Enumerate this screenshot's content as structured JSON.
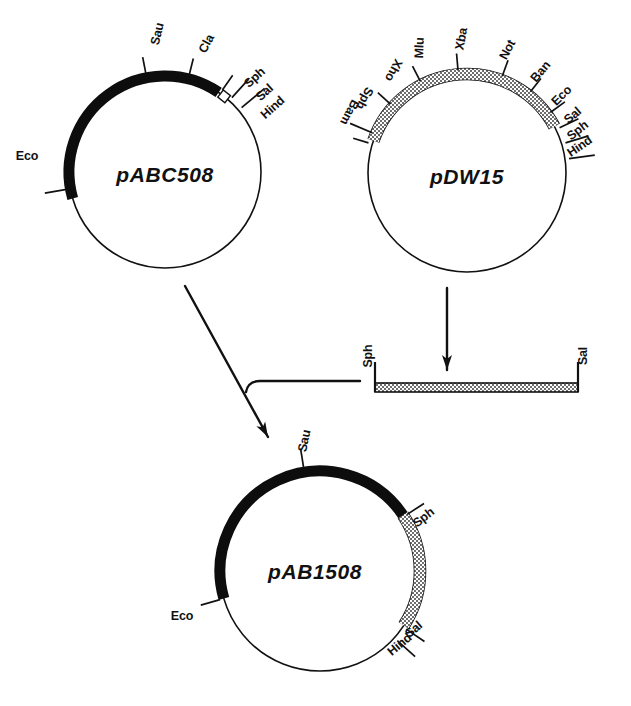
{
  "figure": {
    "background": "#ffffff",
    "ink": "#111111",
    "shaded_fill": "#b4b4b4",
    "black_fill": "#0d0d0d"
  },
  "plasmids": [
    {
      "id": "pABC508",
      "name": "pABC508",
      "name_x": 165,
      "name_y": 176,
      "cx": 165,
      "cy": 172,
      "r": 96,
      "black_arc": {
        "start_deg": 196,
        "end_deg": 56
      },
      "shaded_arc": null,
      "gap_marker": {
        "deg": 52
      },
      "sites": [
        {
          "label": "Sau",
          "deg": 101,
          "tick_len": 17,
          "label_rot": -76,
          "lx": 158,
          "ly": 34
        },
        {
          "label": "Cla",
          "deg": 76,
          "tick_len": 17,
          "label_rot": -62,
          "lx": 207,
          "ly": 44
        },
        {
          "label": "Sph",
          "deg": 55,
          "tick_len": 18,
          "label_rot": -42,
          "lx": 255,
          "ly": 78
        },
        {
          "label": "Sal",
          "deg": 48,
          "tick_len": 25,
          "label_rot": -42,
          "lx": 265,
          "ly": 93
        },
        {
          "label": "Hind",
          "deg": 40,
          "tick_len": 30,
          "label_rot": -42,
          "lx": 273,
          "ly": 108
        },
        {
          "label": "Eco",
          "deg": 190,
          "tick_len": 22,
          "label_rot": 0,
          "lx": 27,
          "ly": 157
        }
      ]
    },
    {
      "id": "pDW15",
      "name": "pDW15",
      "name_x": 467,
      "name_y": 178,
      "cx": 467,
      "cy": 173,
      "r": 99,
      "black_arc": null,
      "shaded_arc": {
        "start_deg": 161,
        "end_deg": 28
      },
      "gap_marker": null,
      "sites": [
        {
          "label": "Bam",
          "deg": 163,
          "tick_len": 16,
          "label_rot": 118,
          "lx": 349,
          "ly": 112
        },
        {
          "label": "Sph",
          "deg": 157,
          "tick_len": 24,
          "label_rot": 118,
          "lx": 364,
          "ly": 98
        },
        {
          "label": "Xho",
          "deg": 138,
          "tick_len": 17,
          "label_rot": 118,
          "lx": 393,
          "ly": 70
        },
        {
          "label": "Mlu",
          "deg": 117,
          "tick_len": 17,
          "label_rot": -88,
          "lx": 420,
          "ly": 48
        },
        {
          "label": "Xba",
          "deg": 95,
          "tick_len": 17,
          "label_rot": -80,
          "lx": 462,
          "ly": 39
        },
        {
          "label": "Not",
          "deg": 70,
          "tick_len": 17,
          "label_rot": -62,
          "lx": 508,
          "ly": 50
        },
        {
          "label": "Ban",
          "deg": 52,
          "tick_len": 17,
          "label_rot": -50,
          "lx": 541,
          "ly": 72
        },
        {
          "label": "Eco",
          "deg": 36,
          "tick_len": 18,
          "label_rot": -44,
          "lx": 562,
          "ly": 96
        },
        {
          "label": "Sal",
          "deg": 26,
          "tick_len": 21,
          "label_rot": -40,
          "lx": 573,
          "ly": 116
        },
        {
          "label": "Sph",
          "deg": 17,
          "tick_len": 24,
          "label_rot": -38,
          "lx": 578,
          "ly": 131
        },
        {
          "label": "Hind",
          "deg": 8,
          "tick_len": 26,
          "label_rot": -34,
          "lx": 580,
          "ly": 147
        }
      ]
    },
    {
      "id": "pAB1508",
      "name": "pAB1508",
      "name_x": 315,
      "name_y": 573,
      "cx": 320,
      "cy": 571,
      "r": 100,
      "black_arc": {
        "start_deg": 196,
        "end_deg": 34
      },
      "shaded_arc": {
        "start_deg": 34,
        "end_deg": -33
      },
      "gap_marker": null,
      "sites": [
        {
          "label": "Sau",
          "deg": 99,
          "tick_len": 20,
          "label_rot": -78,
          "lx": 305,
          "ly": 441
        },
        {
          "label": "Sph",
          "deg": 33,
          "tick_len": 20,
          "label_rot": -38,
          "lx": 424,
          "ly": 518
        },
        {
          "label": "Sal",
          "deg": -34,
          "tick_len": 22,
          "label_rot": -40,
          "lx": 414,
          "ly": 630
        },
        {
          "label": "Hind",
          "deg": -42,
          "tick_len": 24,
          "label_rot": -40,
          "lx": 400,
          "ly": 645
        },
        {
          "label": "Eco",
          "deg": 196,
          "tick_len": 20,
          "label_rot": 0,
          "lx": 182,
          "ly": 617
        }
      ]
    }
  ],
  "fragment": {
    "id": "sph-sal-fragment",
    "x_left": 375,
    "x_right": 578,
    "y_top": 383,
    "height": 9,
    "end_tick_top": 362,
    "labels": [
      {
        "label": "Sph",
        "x": 369,
        "y": 356,
        "rot": -90
      },
      {
        "label": "Sal",
        "x": 584,
        "y": 356,
        "rot": -90
      }
    ]
  },
  "arrows": [
    {
      "id": "pdw15-to-fragment",
      "type": "vertical",
      "x1": 447,
      "y1": 288,
      "x2": 447,
      "y2": 370
    },
    {
      "id": "pabc508-to-pab1508",
      "type": "diagonal",
      "x1": 185,
      "y1": 286,
      "x2": 268,
      "y2": 437
    },
    {
      "id": "fragment-to-pab1508",
      "type": "elbow",
      "x1": 360,
      "y1": 381,
      "x2": 248,
      "y2": 381,
      "corner_y": 392
    }
  ]
}
